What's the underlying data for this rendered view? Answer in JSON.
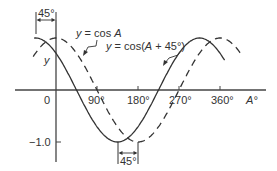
{
  "chart_data": {
    "type": "line",
    "title": "",
    "xlabel": "A°",
    "ylabel": "y",
    "x_ticks": [
      "0",
      "90°",
      "180°",
      "270°",
      "360°"
    ],
    "x_tick_values": [
      0,
      90,
      180,
      270,
      360
    ],
    "y_ticks": [
      "−1.0"
    ],
    "y_tick_values": [
      -1.0
    ],
    "xlim": [
      -50,
      460
    ],
    "ylim": [
      -1.2,
      1.1
    ],
    "grid": false,
    "series": [
      {
        "name": "y = cos A",
        "style": "dashed",
        "function": "cos(A)",
        "x_range": [
          -50,
          410
        ]
      },
      {
        "name": "y = cos(A + 45°)",
        "style": "solid",
        "function": "cos(A+45)",
        "x_range": [
          -48,
          370
        ]
      }
    ],
    "annotations": [
      {
        "text": "45°",
        "position": "top",
        "description": "phase shift between peaks at A = -45° and A = 0"
      },
      {
        "text": "45°",
        "position": "bottom",
        "description": "phase shift between minima at A = 135° and A = 180°"
      }
    ]
  },
  "labels": {
    "y_axis": "y",
    "x_axis": "A°",
    "origin": "0",
    "tick_90": "90°",
    "tick_180": "180°",
    "tick_270": "270°",
    "tick_360": "360°",
    "tick_neg1": "−1.0",
    "cosA_prefix": "y = cos ",
    "cosA_var": "A",
    "cos45_prefix": "y = cos(",
    "cos45_var": "A",
    "cos45_suffix": " + 45°)",
    "shift_top": "45°",
    "shift_bottom": "45°"
  }
}
